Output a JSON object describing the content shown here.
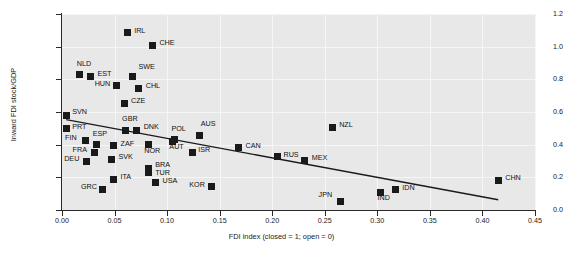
{
  "chart_data": {
    "type": "scatter",
    "title": "",
    "xlabel": "FDI index (closed = 1; open = 0)",
    "ylabel": "Inward FDI stock/GDP",
    "xlim": [
      0.0,
      0.45
    ],
    "ylim": [
      0.0,
      1.2
    ],
    "xticks": [
      "0.00",
      "0.05",
      "0.10",
      "0.15",
      "0.20",
      "0.25",
      "0.30",
      "0.35",
      "0.40",
      "0.45"
    ],
    "xtick_values": [
      0.0,
      0.05,
      0.1,
      0.15,
      0.2,
      0.25,
      0.3,
      0.35,
      0.4,
      0.45
    ],
    "yticks": [
      "0.0",
      "0.2",
      "0.4",
      "0.6",
      "0.8",
      "1.0",
      "1.2"
    ],
    "ytick_values": [
      0.0,
      0.2,
      0.4,
      0.6,
      0.8,
      1.0,
      1.2
    ],
    "grid": true,
    "legend": null,
    "marker_color": "#1a1a1a",
    "plot_background": "#e8e8e8",
    "trendline": {
      "type": "linear-fit",
      "x_start": 0.004,
      "y_start": 0.553,
      "x_end": 0.415,
      "y_end": 0.063,
      "color": "#1a1a1a"
    },
    "points": [
      {
        "label": "IRL",
        "x": 0.062,
        "y": 1.085,
        "label_dx": 7,
        "label_dy": -3
      },
      {
        "label": "CHE",
        "x": 0.086,
        "y": 1.01,
        "label_dx": 7,
        "label_dy": -3
      },
      {
        "label": "NLD",
        "x": 0.017,
        "y": 0.828,
        "label_dx": -3,
        "label_dy": -12
      },
      {
        "label": "EST",
        "x": 0.027,
        "y": 0.818,
        "label_dx": 7,
        "label_dy": -3
      },
      {
        "label": "SWE",
        "x": 0.067,
        "y": 0.815,
        "label_dx": 6,
        "label_dy": -11
      },
      {
        "label": "HUN",
        "x": 0.052,
        "y": 0.76,
        "label_dx": -22,
        "label_dy": -3
      },
      {
        "label": "CHL",
        "x": 0.073,
        "y": 0.745,
        "label_dx": 7,
        "label_dy": -3
      },
      {
        "label": "CZE",
        "x": 0.059,
        "y": 0.655,
        "label_dx": 7,
        "label_dy": -3
      },
      {
        "label": "SVN",
        "x": 0.004,
        "y": 0.58,
        "label_dx": 6,
        "label_dy": -4
      },
      {
        "label": "PRT",
        "x": 0.004,
        "y": 0.497,
        "label_dx": 6,
        "label_dy": -3
      },
      {
        "label": "GBR",
        "x": 0.06,
        "y": 0.487,
        "label_dx": -3,
        "label_dy": -12
      },
      {
        "label": "DNK",
        "x": 0.071,
        "y": 0.487,
        "label_dx": 7,
        "label_dy": -4
      },
      {
        "label": "POL",
        "x": 0.107,
        "y": 0.43,
        "label_dx": -3,
        "label_dy": -12
      },
      {
        "label": "AUS",
        "x": 0.131,
        "y": 0.458,
        "label_dx": 1,
        "label_dy": -12
      },
      {
        "label": "FIN",
        "x": 0.022,
        "y": 0.427,
        "label_dx": -20,
        "label_dy": -3
      },
      {
        "label": "ESP",
        "x": 0.033,
        "y": 0.398,
        "label_dx": -4,
        "label_dy": -12
      },
      {
        "label": "ZAF",
        "x": 0.049,
        "y": 0.392,
        "label_dx": 7,
        "label_dy": -3
      },
      {
        "label": "NOR",
        "x": 0.082,
        "y": 0.4,
        "label_dx": -4,
        "label_dy": 5
      },
      {
        "label": "AUT",
        "x": 0.105,
        "y": 0.417,
        "label_dx": -3,
        "label_dy": 4
      },
      {
        "label": "CAN",
        "x": 0.168,
        "y": 0.38,
        "label_dx": 7,
        "label_dy": -3
      },
      {
        "label": "FRA",
        "x": 0.031,
        "y": 0.355,
        "label_dx": -22,
        "label_dy": -3
      },
      {
        "label": "ISR",
        "x": 0.124,
        "y": 0.355,
        "label_dx": 6,
        "label_dy": -3
      },
      {
        "label": "SVK",
        "x": 0.047,
        "y": 0.312,
        "label_dx": 7,
        "label_dy": -3
      },
      {
        "label": "DEU",
        "x": 0.023,
        "y": 0.3,
        "label_dx": -22,
        "label_dy": -3
      },
      {
        "label": "RUS",
        "x": 0.205,
        "y": 0.325,
        "label_dx": 6,
        "label_dy": -3
      },
      {
        "label": "MEX",
        "x": 0.231,
        "y": 0.305,
        "label_dx": 7,
        "label_dy": -3
      },
      {
        "label": "NZL",
        "x": 0.257,
        "y": 0.508,
        "label_dx": 7,
        "label_dy": -3
      },
      {
        "label": "BRA",
        "x": 0.082,
        "y": 0.253,
        "label_dx": 7,
        "label_dy": -5
      },
      {
        "label": "TUR",
        "x": 0.082,
        "y": 0.232,
        "label_dx": 7,
        "label_dy": 0
      },
      {
        "label": "ITA",
        "x": 0.049,
        "y": 0.187,
        "label_dx": 7,
        "label_dy": -3
      },
      {
        "label": "USA",
        "x": 0.089,
        "y": 0.167,
        "label_dx": 7,
        "label_dy": -3
      },
      {
        "label": "KOR",
        "x": 0.142,
        "y": 0.143,
        "label_dx": -22,
        "label_dy": -3
      },
      {
        "label": "GRC",
        "x": 0.039,
        "y": 0.128,
        "label_dx": -22,
        "label_dy": -3
      },
      {
        "label": "CHN",
        "x": 0.415,
        "y": 0.183,
        "label_dx": 7,
        "label_dy": -3
      },
      {
        "label": "IDN",
        "x": 0.317,
        "y": 0.124,
        "label_dx": 7,
        "label_dy": -3
      },
      {
        "label": "IND",
        "x": 0.303,
        "y": 0.11,
        "label_dx": -3,
        "label_dy": 5
      },
      {
        "label": "JPN",
        "x": 0.265,
        "y": 0.055,
        "label_dx": -22,
        "label_dy": -7
      }
    ]
  }
}
